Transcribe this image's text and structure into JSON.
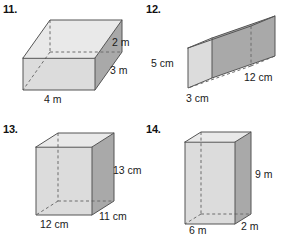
{
  "page": {
    "background_color": "#ffffff",
    "width": 287,
    "height": 238
  },
  "style": {
    "face_top_color": "#e9e9e9",
    "face_front_color": "#dcdcdc",
    "face_right_color": "#a9a9a9",
    "edge_color": "#555555",
    "hidden_edge_color": "#6d6d6d",
    "text_color": "#1a1a1a"
  },
  "problems": [
    {
      "id": "problem-11",
      "number": "11.",
      "shape": "rectangular prism",
      "orientation": "wide flat box",
      "labels": [
        {
          "name": "height-label",
          "text": "2 m",
          "edge": "height"
        },
        {
          "name": "depth-label",
          "text": "3 m",
          "edge": "depth"
        },
        {
          "name": "width-label",
          "text": "4 m",
          "edge": "width"
        }
      ],
      "dimensions": {
        "width": 4,
        "depth": 3,
        "height": 2,
        "unit": "m"
      }
    },
    {
      "id": "problem-12",
      "number": "12.",
      "shape": "rectangular prism",
      "orientation": "long horizontal box",
      "labels": [
        {
          "name": "height-label",
          "text": "5 cm",
          "edge": "height"
        },
        {
          "name": "width-label",
          "text": "3 cm",
          "edge": "width"
        },
        {
          "name": "depth-label",
          "text": "12 cm",
          "edge": "depth"
        }
      ],
      "dimensions": {
        "width": 3,
        "depth": 12,
        "height": 5,
        "unit": "cm"
      }
    },
    {
      "id": "problem-13",
      "number": "13.",
      "shape": "rectangular prism",
      "orientation": "near cube",
      "labels": [
        {
          "name": "height-label",
          "text": "13 cm",
          "edge": "height"
        },
        {
          "name": "depth-label",
          "text": "11 cm",
          "edge": "depth"
        },
        {
          "name": "width-label",
          "text": "12 cm",
          "edge": "width"
        }
      ],
      "dimensions": {
        "width": 12,
        "depth": 11,
        "height": 13,
        "unit": "cm"
      }
    },
    {
      "id": "problem-14",
      "number": "14.",
      "shape": "rectangular prism",
      "orientation": "tall thin box",
      "labels": [
        {
          "name": "height-label",
          "text": "9 m",
          "edge": "height"
        },
        {
          "name": "width-label",
          "text": "6 m",
          "edge": "width"
        },
        {
          "name": "depth-label",
          "text": "2 m",
          "edge": "depth"
        }
      ],
      "dimensions": {
        "width": 6,
        "depth": 2,
        "height": 9,
        "unit": "m"
      }
    }
  ]
}
